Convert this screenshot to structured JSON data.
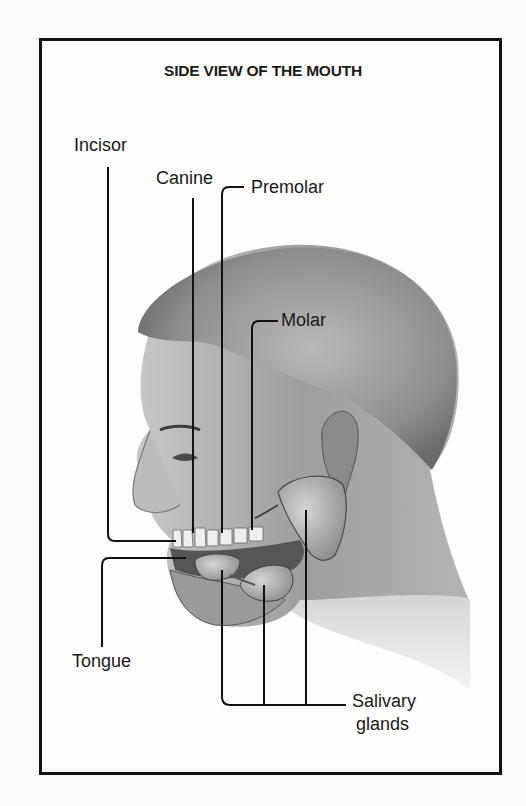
{
  "diagram": {
    "title": "SIDE VIEW OF THE MOUTH",
    "labels": {
      "incisor": "Incisor",
      "canine": "Canine",
      "premolar": "Premolar",
      "molar": "Molar",
      "tongue": "Tongue",
      "salivary_line1": "Salivary",
      "salivary_line2": "glands"
    },
    "colors": {
      "frame": "#111111",
      "background": "#fdfdfc",
      "skin_dark": "#6b6b6b",
      "skin_mid": "#a3a3a3",
      "skin_light": "#d8d8d8",
      "leader_line": "#111111"
    }
  }
}
